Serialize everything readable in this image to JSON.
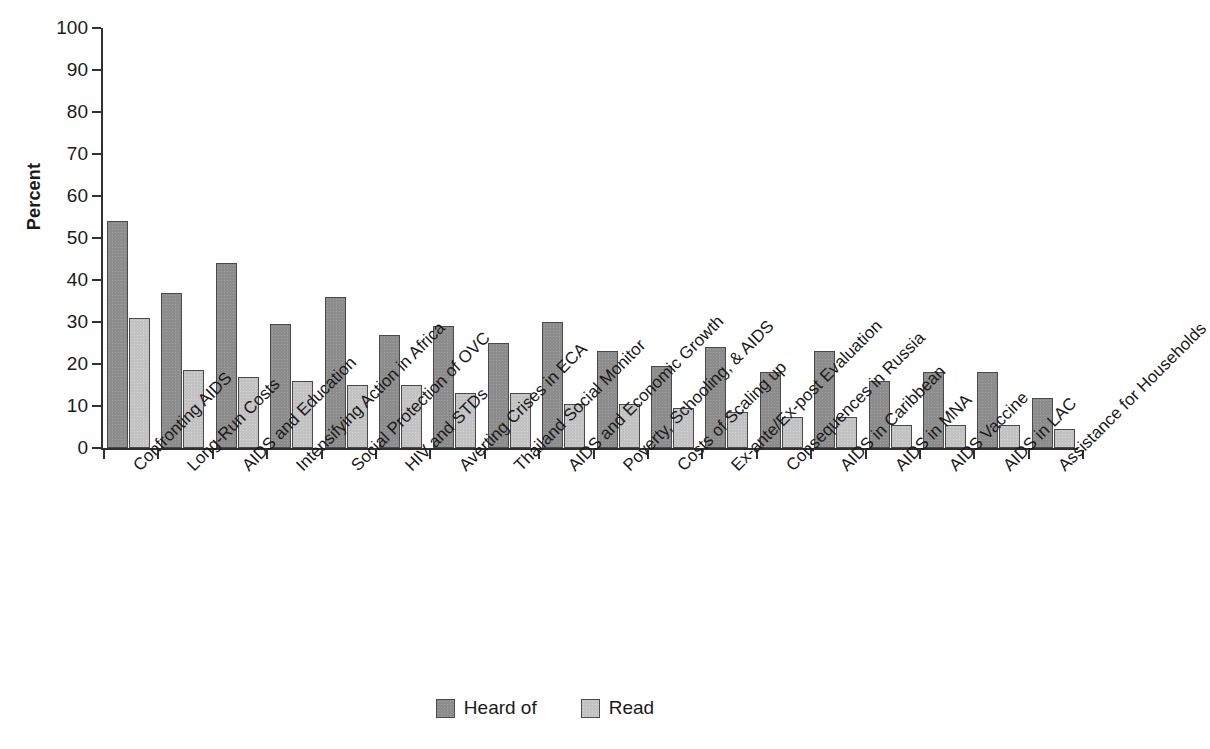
{
  "chart_data": {
    "type": "bar",
    "title": "",
    "subtitle": "",
    "xlabel": "",
    "ylabel": "Percent",
    "ylim": [
      0,
      100
    ],
    "ytick_labels": [
      "100",
      "90",
      "80",
      "70",
      "60",
      "50",
      "40",
      "30",
      "20",
      "10",
      "0"
    ],
    "ytick_values": [
      100,
      90,
      80,
      70,
      60,
      50,
      40,
      30,
      20,
      10,
      0
    ],
    "grid": false,
    "legend_position": "bottom-center",
    "categories": [
      "Confronting AIDS",
      "Long-Run Costs",
      "AIDS and Education",
      "Intensifying Action in Africa",
      "Social Protection of OVC",
      "HIV and STDs",
      "Averting Crises in ECA",
      "Thailand Social Monitor",
      "AIDS and Economic Growth",
      "Poverty, Schooling, & AIDS",
      "Costs of Scaling up",
      "Ex-ante/Ex-post Evaluation",
      "Consequences in Russia",
      "AIDS in Caribbean",
      "AIDS in MNA",
      "AIDS Vaccine",
      "AIDS in LAC",
      "Assistance for Households"
    ],
    "series": [
      {
        "name": "Heard of",
        "color": "#8c8c8c",
        "values": [
          54,
          37,
          44,
          29.5,
          36,
          27,
          29,
          25,
          30,
          23,
          19.5,
          24,
          18,
          23,
          16,
          18,
          18,
          12
        ]
      },
      {
        "name": "Read",
        "color": "#c2c2c2",
        "values": [
          31,
          18.5,
          17,
          16,
          15,
          15,
          13,
          13,
          10.5,
          10.5,
          9.5,
          8.5,
          7.5,
          7.5,
          5.5,
          5.5,
          5.5,
          4.5
        ]
      }
    ]
  },
  "legend": {
    "items": [
      {
        "label": "Heard of",
        "swatch": "heard"
      },
      {
        "label": "Read",
        "swatch": "read"
      }
    ]
  },
  "axis": {
    "y_title": "Percent"
  }
}
